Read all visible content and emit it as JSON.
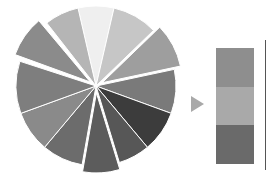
{
  "pie": {
    "center": [
      96,
      86
    ],
    "radius": 80,
    "slices": [
      {
        "start": -13,
        "end": 13,
        "color": "#efefef",
        "explode": 0
      },
      {
        "start": 13,
        "end": 46,
        "color": "#c6c6c6",
        "explode": 0
      },
      {
        "start": 46,
        "end": 78,
        "color": "#9e9e9e",
        "explode": 7
      },
      {
        "start": 78,
        "end": 110,
        "color": "#7a7a7a",
        "explode": 0
      },
      {
        "start": 110,
        "end": 140,
        "color": "#3c3c3c",
        "explode": 0
      },
      {
        "start": 140,
        "end": 163,
        "color": "#575757",
        "explode": 0
      },
      {
        "start": 163,
        "end": 190,
        "color": "#5c5c5c",
        "explode": 7
      },
      {
        "start": 190,
        "end": 220,
        "color": "#6c6c6c",
        "explode": 0
      },
      {
        "start": 220,
        "end": 250,
        "color": "#8a8a8a",
        "explode": 0
      },
      {
        "start": 250,
        "end": 288,
        "color": "#7e7e7e",
        "explode": 0
      },
      {
        "start": 290,
        "end": 320,
        "color": "#8b8b8b",
        "explode": 7
      },
      {
        "start": 322,
        "end": 347,
        "color": "#b5b5b5",
        "explode": 0
      }
    ]
  },
  "stack": {
    "segments": [
      {
        "color": "#8e8e8e"
      },
      {
        "color": "#a9a9a9"
      },
      {
        "color": "#6a6a6a"
      }
    ]
  }
}
